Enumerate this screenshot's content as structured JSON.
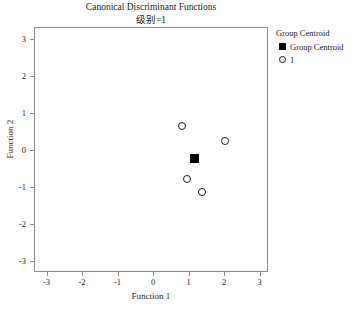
{
  "chart_data": {
    "type": "scatter",
    "title": "Canonical Discriminant Functions",
    "subtitle": "级别=1",
    "xlabel": "Function 1",
    "ylabel": "Function 2",
    "xlim": [
      -3.3,
      3.3
    ],
    "ylim": [
      -3.3,
      3.3
    ],
    "xticks": [
      "-3",
      "-2",
      "-1",
      "0",
      "1",
      "2",
      "3"
    ],
    "xtick_values": [
      -3,
      -2,
      -1,
      0,
      1,
      2,
      3
    ],
    "yticks": [
      "3",
      "2",
      "1",
      "0",
      "-1",
      "-2",
      "-3"
    ],
    "ytick_values": [
      3,
      2,
      1,
      0,
      -1,
      -2,
      -3
    ],
    "grid": false,
    "legend_position": "right",
    "legend_title": "Group Centroid",
    "series": [
      {
        "name": "1",
        "marker": "open-circle",
        "points": [
          {
            "x": 0.8,
            "y": 0.68
          },
          {
            "x": 2.0,
            "y": 0.28
          },
          {
            "x": 0.93,
            "y": -0.76
          },
          {
            "x": 1.35,
            "y": -1.11
          }
        ]
      },
      {
        "name": "Group Centroid",
        "marker": "filled-square",
        "points": [
          {
            "x": 1.15,
            "y": -0.19
          }
        ]
      }
    ]
  },
  "legend": {
    "title": "Group Centroid",
    "entries": [
      {
        "label": "Group Centroid",
        "marker": "filled-square"
      },
      {
        "label": "1",
        "marker": "open-circle"
      }
    ]
  },
  "colors": {
    "marker": "#1a1a1a",
    "centroid": "#000000",
    "frame": "#8a8a8a",
    "background": "#ffffff"
  }
}
